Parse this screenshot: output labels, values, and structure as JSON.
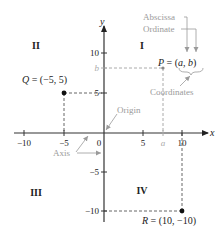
{
  "diagram": {
    "type": "cartesian-coordinate-plane",
    "axes": {
      "x_label": "x",
      "y_label": "y",
      "x_ticks": [
        "−10",
        "−5",
        "0",
        "5",
        "10"
      ],
      "y_ticks": [
        "10",
        "5",
        "−5",
        "−10"
      ],
      "x_symbolic_tick": "a",
      "y_symbolic_tick": "b"
    },
    "quadrants": {
      "q1": "I",
      "q2": "II",
      "q3": "III",
      "q4": "IV"
    },
    "points": {
      "P": {
        "label": "P = (a, b)",
        "name": "P",
        "eq": " = (",
        "a": "a",
        "comma": ", ",
        "b": "b",
        "close": ")"
      },
      "Q": {
        "label": "Q = (−5, 5)",
        "name": "Q",
        "rest": " = (−5, 5)",
        "x": -5,
        "y": 5
      },
      "R": {
        "label": "R = (10, −10)",
        "name": "R",
        "rest": " = (10, −10)",
        "x": 10,
        "y": -10
      }
    },
    "annotations": {
      "abscissa": "Abscissa",
      "ordinate": "Ordinate",
      "coordinates": "Coordinates",
      "origin": "Origin",
      "axis": "Axis"
    },
    "colors": {
      "axis": "#333333",
      "annotation": "#9a9a9a",
      "text": "#222222"
    }
  }
}
